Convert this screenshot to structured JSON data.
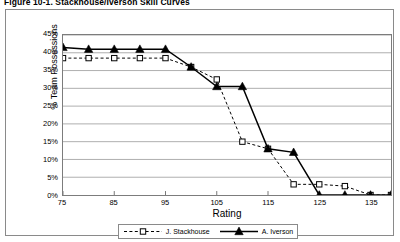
{
  "figure": {
    "caption": "Figure 10-1. Stackhouse/Iverson Skill Curves"
  },
  "chart_data": {
    "type": "line",
    "title": "Figure 10-1. Stackhouse/Iverson Skill Curves",
    "xlabel": "Rating",
    "ylabel": "% Team Possessions",
    "xlim": [
      75,
      139
    ],
    "ylim": [
      0,
      45
    ],
    "xticks": [
      75,
      85,
      95,
      105,
      115,
      125,
      135
    ],
    "xtick_labels": [
      "75",
      "85",
      "95",
      "105",
      "115",
      "125",
      "135"
    ],
    "yticks": [
      0,
      5,
      10,
      15,
      20,
      25,
      30,
      35,
      40,
      45
    ],
    "ytick_labels": [
      "0%",
      "5%",
      "10%",
      "15%",
      "20%",
      "25%",
      "30%",
      "35%",
      "40%",
      "45%"
    ],
    "grid": "horizontal",
    "legend_position": "bottom",
    "x": [
      75,
      80,
      85,
      90,
      95,
      100,
      105,
      110,
      115,
      120,
      125,
      130,
      135,
      139
    ],
    "series": [
      {
        "name": "J. Stackhouse",
        "line_style": "dashed",
        "marker": "open-square",
        "color": "#000000",
        "values": [
          38.5,
          38.5,
          38.5,
          38.5,
          38.5,
          36.0,
          32.5,
          15.0,
          13.0,
          3.0,
          3.0,
          2.5,
          0.0,
          0.0
        ]
      },
      {
        "name": "A. Iverson",
        "line_style": "solid",
        "marker": "filled-triangle",
        "color": "#000000",
        "values": [
          41.5,
          41.0,
          41.0,
          41.0,
          41.0,
          36.0,
          30.5,
          30.5,
          13.0,
          12.0,
          0.0,
          0.0,
          0.0,
          0.0
        ]
      }
    ]
  },
  "legend": {
    "entries": [
      {
        "label": "J. Stackhouse"
      },
      {
        "label": "A. Iverson"
      }
    ]
  }
}
